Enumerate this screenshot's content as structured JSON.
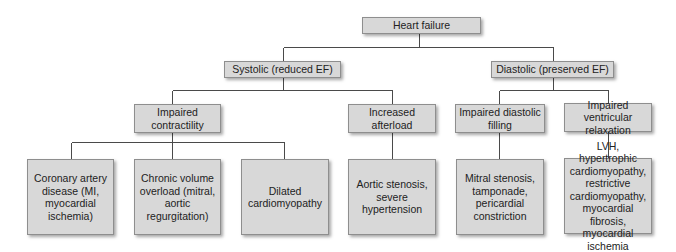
{
  "diagram": {
    "title": "Heart failure",
    "colors": {
      "box_fill": "#d8d8d8",
      "box_border": "#8e8e8e",
      "line": "#4a4a4a",
      "background": "#ffffff"
    },
    "root": {
      "label": "Heart failure"
    },
    "level1": [
      {
        "id": "systolic",
        "label": "Systolic (reduced EF)"
      },
      {
        "id": "diastolic",
        "label": "Diastolic (preserved EF)"
      }
    ],
    "level2": [
      {
        "id": "impaired-contractility",
        "parent": "systolic",
        "lines": [
          "Impaired",
          "contractility"
        ]
      },
      {
        "id": "increased-afterload",
        "parent": "systolic",
        "lines": [
          "Increased",
          "afterload"
        ]
      },
      {
        "id": "impaired-diastolic-filling",
        "parent": "diastolic",
        "lines": [
          "Impaired diastolic",
          "filling"
        ]
      },
      {
        "id": "impaired-ventricular-relaxation",
        "parent": "diastolic",
        "lines": [
          "Impaired ventricular",
          "relaxation"
        ]
      }
    ],
    "level3": [
      {
        "id": "cad",
        "parent": "impaired-contractility",
        "lines": [
          "Coronary artery",
          "disease (MI,",
          "myocardial ischemia)"
        ]
      },
      {
        "id": "volume-overload",
        "parent": "impaired-contractility",
        "lines": [
          "Chronic volume",
          "overload (mitral,",
          "aortic regurgitation)"
        ]
      },
      {
        "id": "dcm",
        "parent": "impaired-contractility",
        "lines": [
          "Dilated",
          "cardiomyopathy"
        ]
      },
      {
        "id": "aortic-stenosis",
        "parent": "increased-afterload",
        "lines": [
          "Aortic stenosis,",
          "severe hypertension"
        ]
      },
      {
        "id": "mitral-stenosis",
        "parent": "impaired-diastolic-filling",
        "lines": [
          "Mitral stenosis,",
          "tamponade,",
          "pericardial",
          "constriction"
        ]
      },
      {
        "id": "lvh",
        "parent": "impaired-ventricular-relaxation",
        "lines": [
          "LVH, hypertrophic",
          "cardiomyopathy,",
          "restrictive",
          "cardiomyopathy,",
          "myocardial fibrosis,",
          "myocardial ischemia"
        ]
      }
    ]
  }
}
